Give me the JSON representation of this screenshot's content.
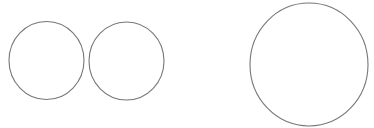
{
  "diagram": {
    "background": "#ffffff",
    "stroke_color": "#777777",
    "stroke_width": 1.1,
    "shapes": [
      {
        "id": "circle-left",
        "type": "ellipse",
        "cx": 46.5,
        "cy": 60.5,
        "rx": 37.5,
        "ry": 39,
        "fill": "#ffffff"
      },
      {
        "id": "circle-middle",
        "type": "ellipse",
        "cx": 126.5,
        "cy": 61,
        "rx": 37.5,
        "ry": 39,
        "fill": "#ffffff"
      },
      {
        "id": "circle-large-right",
        "type": "ellipse",
        "cx": 309,
        "cy": 64.5,
        "rx": 59,
        "ry": 61.5,
        "fill": "#ffffff"
      }
    ]
  }
}
